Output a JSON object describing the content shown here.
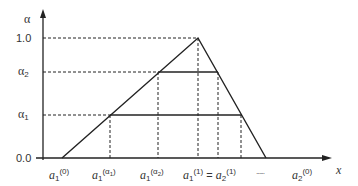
{
  "diagram": {
    "type": "fuzzy-number-alpha-cuts",
    "y_axis": {
      "label": "α",
      "ticks": [
        {
          "id": "one",
          "label": "1.0",
          "value": 1.0
        },
        {
          "id": "alpha2",
          "label": "α",
          "sub": "2",
          "value": 0.7
        },
        {
          "id": "alpha1",
          "label": "α",
          "sub": "1",
          "value": 0.35
        },
        {
          "id": "zero",
          "label": "0.0",
          "value": 0.0
        }
      ]
    },
    "x_axis": {
      "label": "x",
      "ticks": [
        {
          "id": "a1_0",
          "base": "a",
          "sub": "1",
          "sup": "(0)"
        },
        {
          "id": "a1_alpha1",
          "base": "a",
          "sub": "1",
          "sup": "(α",
          "sup_sub": "1",
          "sup_close": ")"
        },
        {
          "id": "a1_alpha2",
          "base": "a",
          "sub": "1",
          "sup": "(α",
          "sup_sub": "2",
          "sup_close": ")"
        },
        {
          "id": "a1_1_eq_a2_1",
          "base": "a",
          "sub": "1",
          "sup": "(1)",
          "eq": " = ",
          "base2": "a",
          "sub2": "2",
          "sup2": "(1)"
        },
        {
          "id": "ellipsis",
          "text": "······"
        },
        {
          "id": "a2_0",
          "base": "a",
          "sub": "2",
          "sup": "(0)"
        }
      ]
    },
    "shape": {
      "description": "Triangular membership function with horizontal alpha-cut lines at α1 and α2 and dashed projections to axes"
    }
  }
}
